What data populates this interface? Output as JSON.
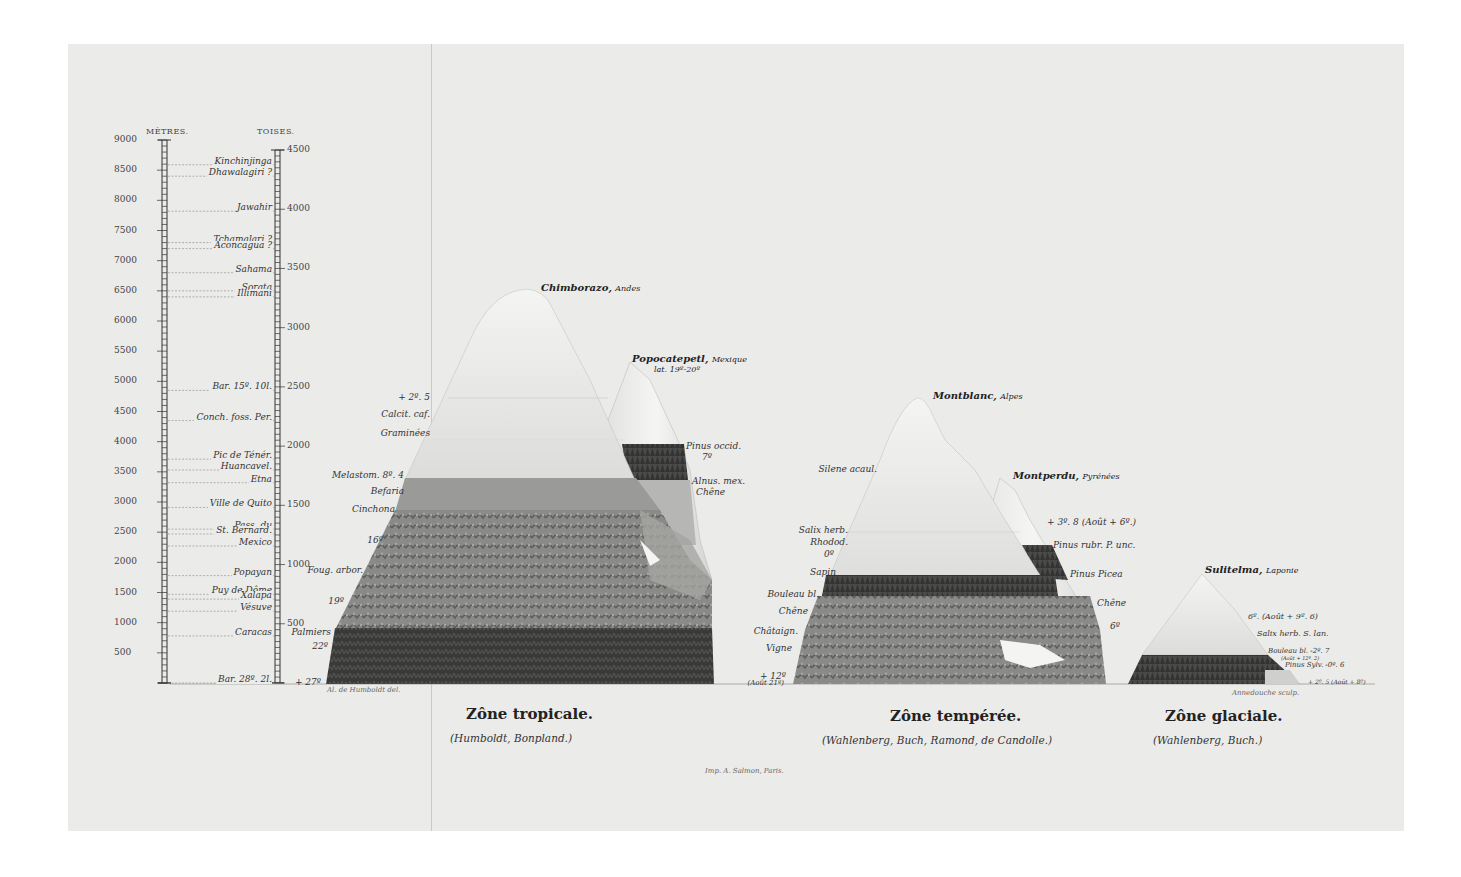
{
  "plate": {
    "background": "#ebebea",
    "ink": "#2a2a2a"
  },
  "scale": {
    "metres_header": "MÈTRES.",
    "toises_header": "TOISES.",
    "metres_ticks": [
      "9000",
      "8500",
      "8000",
      "7500",
      "7000",
      "6500",
      "6000",
      "5500",
      "5000",
      "4500",
      "4000",
      "3500",
      "3000",
      "2500",
      "2000",
      "1500",
      "1000",
      "500"
    ],
    "toises_ticks": [
      "4500",
      "4000",
      "3500",
      "3000",
      "2500",
      "2000",
      "1500",
      "1000",
      "500"
    ],
    "reference_heights": [
      {
        "label": "Kinchinjinga",
        "metres": 8590
      },
      {
        "label": "Dhawalagiri ?",
        "metres": 8400
      },
      {
        "label": "Jawahir",
        "metres": 7820
      },
      {
        "label": "Tchamalari ?",
        "metres": 7300
      },
      {
        "label": "Aconcagua ?",
        "metres": 7200
      },
      {
        "label": "Sahama",
        "metres": 6800
      },
      {
        "label": "Sorata",
        "metres": 6500
      },
      {
        "label": "Illimani",
        "metres": 6400
      },
      {
        "label": "Bar. 15º. 10l.",
        "metres": 4850
      },
      {
        "label": "Conch. foss. Per.",
        "metres": 4350
      },
      {
        "label": "Pic de Ténér.",
        "metres": 3710
      },
      {
        "label": "Huancavel.",
        "metres": 3530
      },
      {
        "label": "Etna",
        "metres": 3320
      },
      {
        "label": "Ville de Quito",
        "metres": 2910
      },
      {
        "label": "Pass. du",
        "metres": 2550
      },
      {
        "label": "St. Bernard.",
        "metres": 2470
      },
      {
        "label": "Mexico",
        "metres": 2270
      },
      {
        "label": "Popayan",
        "metres": 1780
      },
      {
        "label": "Puy de Dôme",
        "metres": 1470
      },
      {
        "label": "Xalapa",
        "metres": 1390
      },
      {
        "label": "Vésuve",
        "metres": 1190
      },
      {
        "label": "Caracas",
        "metres": 780
      },
      {
        "label": "Bar. 28º. 2l.",
        "metres": 0
      }
    ]
  },
  "zones": [
    {
      "title": "Zône tropicale.",
      "authors": "(Humboldt, Bonpland.)",
      "peaks": [
        {
          "name": "Chimborazo",
          "region": "Andes"
        },
        {
          "name": "Popocatepetl",
          "region": "Mexique",
          "note": "lat. 19º-20º"
        }
      ],
      "left_labels": [
        "+ 2º. 5",
        "Calcit. caf.",
        "Graminées",
        "Melastom. 8º. 4",
        "Befaria",
        "Cinchona",
        "16º",
        "Foug. arbor.",
        "19º",
        "Palmiers",
        "22º",
        "+ 27º"
      ],
      "right_labels": [
        "Pinus occid.",
        "7º",
        "Alnus. mex.",
        "Chêne"
      ]
    },
    {
      "title": "Zône tempérée.",
      "authors": "(Wahlenberg, Buch, Ramond, de Candolle.)",
      "peaks": [
        {
          "name": "Montblanc",
          "region": "Alpes"
        },
        {
          "name": "Montperdu",
          "region": "Pyrénées"
        }
      ],
      "left_labels": [
        "Silene acaul.",
        "Salix herb.",
        "Rhodod.",
        "0º",
        "Sapin",
        "Bouleau bl.",
        "Chêne",
        "Châtaign.",
        "Vigne",
        "+ 12º",
        "(Août 21º)"
      ],
      "right_labels": [
        "+ 3º. 8 (Août + 6º.)",
        "Pinus rubr. P. unc.",
        "Pinus Picea",
        "Chêne",
        "6º"
      ]
    },
    {
      "title": "Zône glaciale.",
      "authors": "(Wahlenberg, Buch.)",
      "peaks": [
        {
          "name": "Sulitelma",
          "region": "Laponie"
        }
      ],
      "right_labels": [
        "6º. (Août + 9º. 6)",
        "Salix herb. S. lan.",
        "Bouleau bl. -2º. 7",
        "(Août + 12º. 2)",
        "Pinus Sylv. -0º. 6",
        "+ 2º. 5 (Août + 8º)"
      ]
    }
  ],
  "credits": {
    "delineator": "Al. de Humboldt del.",
    "engraver": "Annedouche sculp.",
    "printer": "Imp. A. Salmon, Paris."
  }
}
